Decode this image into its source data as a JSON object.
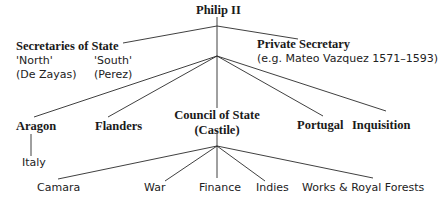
{
  "diagram": {
    "root": {
      "label": "Philip II"
    },
    "secretaries": {
      "title": "Secretaries of State",
      "north_label": "'North'",
      "north_name": "(De Zayas)",
      "south_label": "'South'",
      "south_name": "(Perez)"
    },
    "private_secretary": {
      "title": "Private Secretary",
      "detail": "(e.g. Mateo Vazquez 1571–1593)"
    },
    "councils": {
      "aragon": "Aragon",
      "italy": "Italy",
      "flanders": "Flanders",
      "state_line1": "Council of State",
      "state_line2": "(Castile)",
      "portugal": "Portugal",
      "inquisition": "Inquisition"
    },
    "castile_subcouncils": {
      "camara": "Camara",
      "war": "War",
      "finance": "Finance",
      "indies": "Indies",
      "works": "Works & Royal Forests"
    },
    "colors": {
      "line": "#2a2a2a",
      "text": "#1a1a1a",
      "background": "#ffffff"
    }
  }
}
